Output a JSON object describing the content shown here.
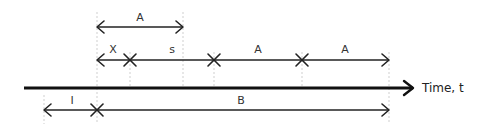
{
  "diagram": {
    "axis_label": "Time, t",
    "guides_x": [
      44,
      97,
      130,
      183,
      214,
      302,
      389
    ],
    "rows": {
      "top": {
        "y": 27,
        "segments": [
          {
            "label": "A",
            "from": 97,
            "to": 183,
            "left_end": "arrow",
            "right_end": "arrow"
          }
        ]
      },
      "middle": {
        "y": 60,
        "segments": [
          {
            "label": "X",
            "from": 97,
            "to": 130,
            "left_end": "arrow",
            "right_end": "cross"
          },
          {
            "label": "s",
            "from": 130,
            "to": 214,
            "left_end": "cross",
            "right_end": "cross"
          },
          {
            "label": "A",
            "from": 214,
            "to": 302,
            "left_end": "cross",
            "right_end": "cross"
          },
          {
            "label": "A",
            "from": 302,
            "to": 389,
            "left_end": "cross",
            "right_end": "arrow"
          }
        ]
      },
      "bottom": {
        "y": 110,
        "segments": [
          {
            "label": "I",
            "from": 44,
            "to": 97,
            "left_end": "arrow",
            "right_end": "cross"
          },
          {
            "label": "B",
            "from": 97,
            "to": 389,
            "left_end": "cross",
            "right_end": "arrow"
          }
        ]
      }
    },
    "labels": {
      "top_a": "A",
      "mid_x": "X",
      "mid_s": "s",
      "mid_a1": "A",
      "mid_a2": "A",
      "bot_i": "I",
      "bot_b": "B"
    },
    "colors": {
      "line": "#222222",
      "axis": "#111111",
      "guide": "#cfcfcf"
    }
  }
}
